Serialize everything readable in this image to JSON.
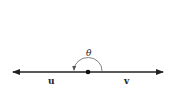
{
  "diagram": {
    "type": "angle-between-vectors",
    "angle_label": "θ",
    "vectors": [
      {
        "name": "u",
        "direction": "left"
      },
      {
        "name": "v",
        "direction": "right"
      }
    ],
    "angle_description": "θ = 180° (straight angle)",
    "colors": {
      "ink": "#222222",
      "background": "#ffffff"
    }
  }
}
